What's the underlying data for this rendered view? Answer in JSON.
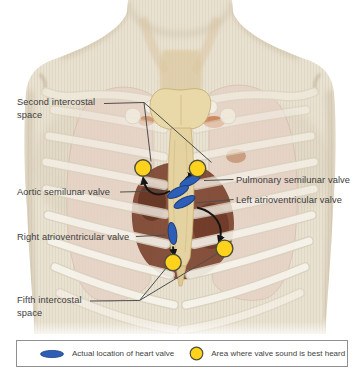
{
  "labels": {
    "second_intercostal": "Second intercostal space",
    "aortic": "Aortic semilunar valve",
    "right_av": "Right atrioventricular valve",
    "fifth_intercostal": "Fifth intercostal space",
    "pulmonary": "Pulmonary semilunar valve",
    "left_av": "Left atrioventricular valve"
  },
  "legend": {
    "valve_location": "Actual location of heart valve",
    "sound_area": "Area where valve sound is best heard"
  },
  "colors": {
    "valve_marker_fill": "#2e5eb5",
    "valve_marker_stroke": "#1a3f7e",
    "sound_marker_fill": "#ffd21e",
    "sound_marker_stroke": "#4f4f38",
    "arrow": "#151515",
    "leader_line": "#4d4d4d",
    "label_text": "#3d3d3d",
    "legend_border": "#909090",
    "skin": "#eae2d1",
    "lung": "#e6d2c6",
    "bone": "#e9d9a9",
    "heart": "#7c432f"
  }
}
